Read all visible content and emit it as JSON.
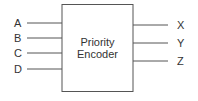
{
  "block": {
    "title_line1": "Priority",
    "title_line2": "Encoder"
  },
  "inputs": [
    {
      "label": "A"
    },
    {
      "label": "B"
    },
    {
      "label": "C"
    },
    {
      "label": "D"
    }
  ],
  "outputs": [
    {
      "label": "X"
    },
    {
      "label": "Y"
    },
    {
      "label": "Z"
    }
  ],
  "colors": {
    "stroke": "#555555",
    "text": "#333333"
  }
}
